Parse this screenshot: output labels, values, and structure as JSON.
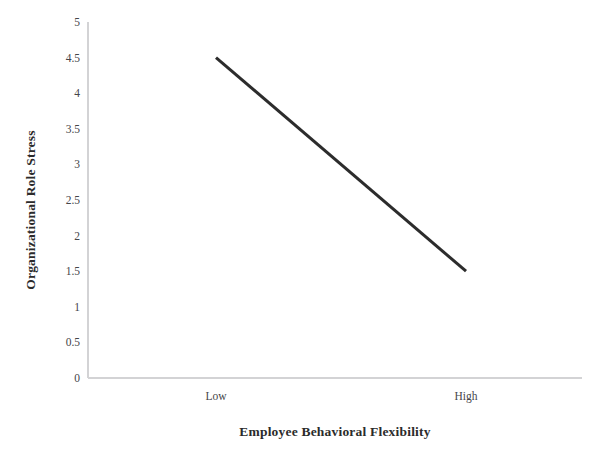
{
  "chart_data": {
    "type": "line",
    "title": "",
    "subtitle": "",
    "xlabel": "Employee Behavioral Flexibility",
    "ylabel": "Organizational Role Stress",
    "categories": [
      "Low",
      "High"
    ],
    "x": [
      0,
      1
    ],
    "values": [
      4.5,
      1.5
    ],
    "series": [
      {
        "name": "Organizational Role Stress",
        "values": [
          4.5,
          1.5
        ],
        "color": "#2c2c2c"
      }
    ],
    "ylim": [
      0,
      5
    ],
    "ytick_labels": [
      "0",
      "0.5",
      "1",
      "1.5",
      "2",
      "2.5",
      "3",
      "3.5",
      "4",
      "4.5",
      "5"
    ],
    "ytick_values": [
      0,
      0.5,
      1,
      1.5,
      2,
      2.5,
      3,
      3.5,
      4,
      4.5,
      5
    ],
    "xtick_labels": [
      "Low",
      "High"
    ],
    "grid": false,
    "legend": false,
    "legend_position": "none",
    "annotations": [],
    "axis_color": "#d3d3d5",
    "line_width_px": 3,
    "background": "#ffffff"
  },
  "geometry": {
    "plot_left": 88,
    "plot_right": 582,
    "plot_top": 22,
    "plot_bottom": 378,
    "point_x": [
      216,
      466
    ]
  }
}
